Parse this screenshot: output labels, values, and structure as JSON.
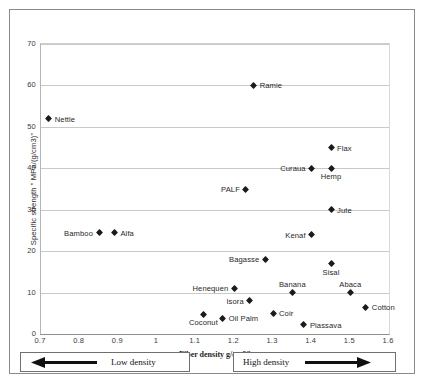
{
  "chart_data": {
    "type": "scatter",
    "title": "",
    "xlabel": "Fiber density  g/cm3\"",
    "ylabel": "Specific strength \" MPa/(g/cm3)\"",
    "xlim": [
      0.7,
      1.6
    ],
    "ylim": [
      0,
      70
    ],
    "xticks": [
      "0.7",
      "0.8",
      "0.9",
      "1",
      "1.1",
      "1.2",
      "1.3",
      "1.4",
      "1.5",
      "1.6"
    ],
    "yticks": [
      "0",
      "10",
      "20",
      "30",
      "40",
      "50",
      "60",
      "70"
    ],
    "grid": "horizontal",
    "legend": "none",
    "marker": "diamond",
    "marker_color": "#1b1b1b",
    "points": [
      {
        "label": "Nettle",
        "x": 0.72,
        "y": 52.0,
        "pos": "right"
      },
      {
        "label": "Ramie",
        "x": 1.25,
        "y": 60.0,
        "pos": "right"
      },
      {
        "label": "Flax",
        "x": 1.45,
        "y": 45.0,
        "pos": "right"
      },
      {
        "label": "Curaua",
        "x": 1.4,
        "y": 40.0,
        "pos": "left"
      },
      {
        "label": "Hemp",
        "x": 1.45,
        "y": 40.0,
        "pos": "below"
      },
      {
        "label": "PALF",
        "x": 1.23,
        "y": 35.0,
        "pos": "left"
      },
      {
        "label": "Jute",
        "x": 1.45,
        "y": 30.0,
        "pos": "right"
      },
      {
        "label": "Bamboo",
        "x": 0.85,
        "y": 24.5,
        "pos": "left"
      },
      {
        "label": "Alfa",
        "x": 0.89,
        "y": 24.5,
        "pos": "right"
      },
      {
        "label": "Kenaf",
        "x": 1.4,
        "y": 24.0,
        "pos": "left"
      },
      {
        "label": "Bagasse",
        "x": 1.28,
        "y": 18.0,
        "pos": "left"
      },
      {
        "label": "Sisal",
        "x": 1.45,
        "y": 17.0,
        "pos": "below"
      },
      {
        "label": "Henequen",
        "x": 1.2,
        "y": 11.0,
        "pos": "left"
      },
      {
        "label": "Banana",
        "x": 1.35,
        "y": 10.0,
        "pos": "above"
      },
      {
        "label": "Abaca",
        "x": 1.5,
        "y": 10.0,
        "pos": "above"
      },
      {
        "label": "Isora",
        "x": 1.24,
        "y": 8.0,
        "pos": "left"
      },
      {
        "label": "Cotton",
        "x": 1.54,
        "y": 6.5,
        "pos": "right"
      },
      {
        "label": "Coir",
        "x": 1.3,
        "y": 5.0,
        "pos": "right"
      },
      {
        "label": "Coconut",
        "x": 1.12,
        "y": 4.8,
        "pos": "below"
      },
      {
        "label": "Oil Palm",
        "x": 1.17,
        "y": 3.8,
        "pos": "right"
      },
      {
        "label": "Piassava",
        "x": 1.38,
        "y": 2.2,
        "pos": "right"
      }
    ],
    "annotations": [
      {
        "name": "low-density",
        "text": "Low density",
        "arrow": "left"
      },
      {
        "name": "high-density",
        "text": "High density",
        "arrow": "right"
      }
    ]
  }
}
